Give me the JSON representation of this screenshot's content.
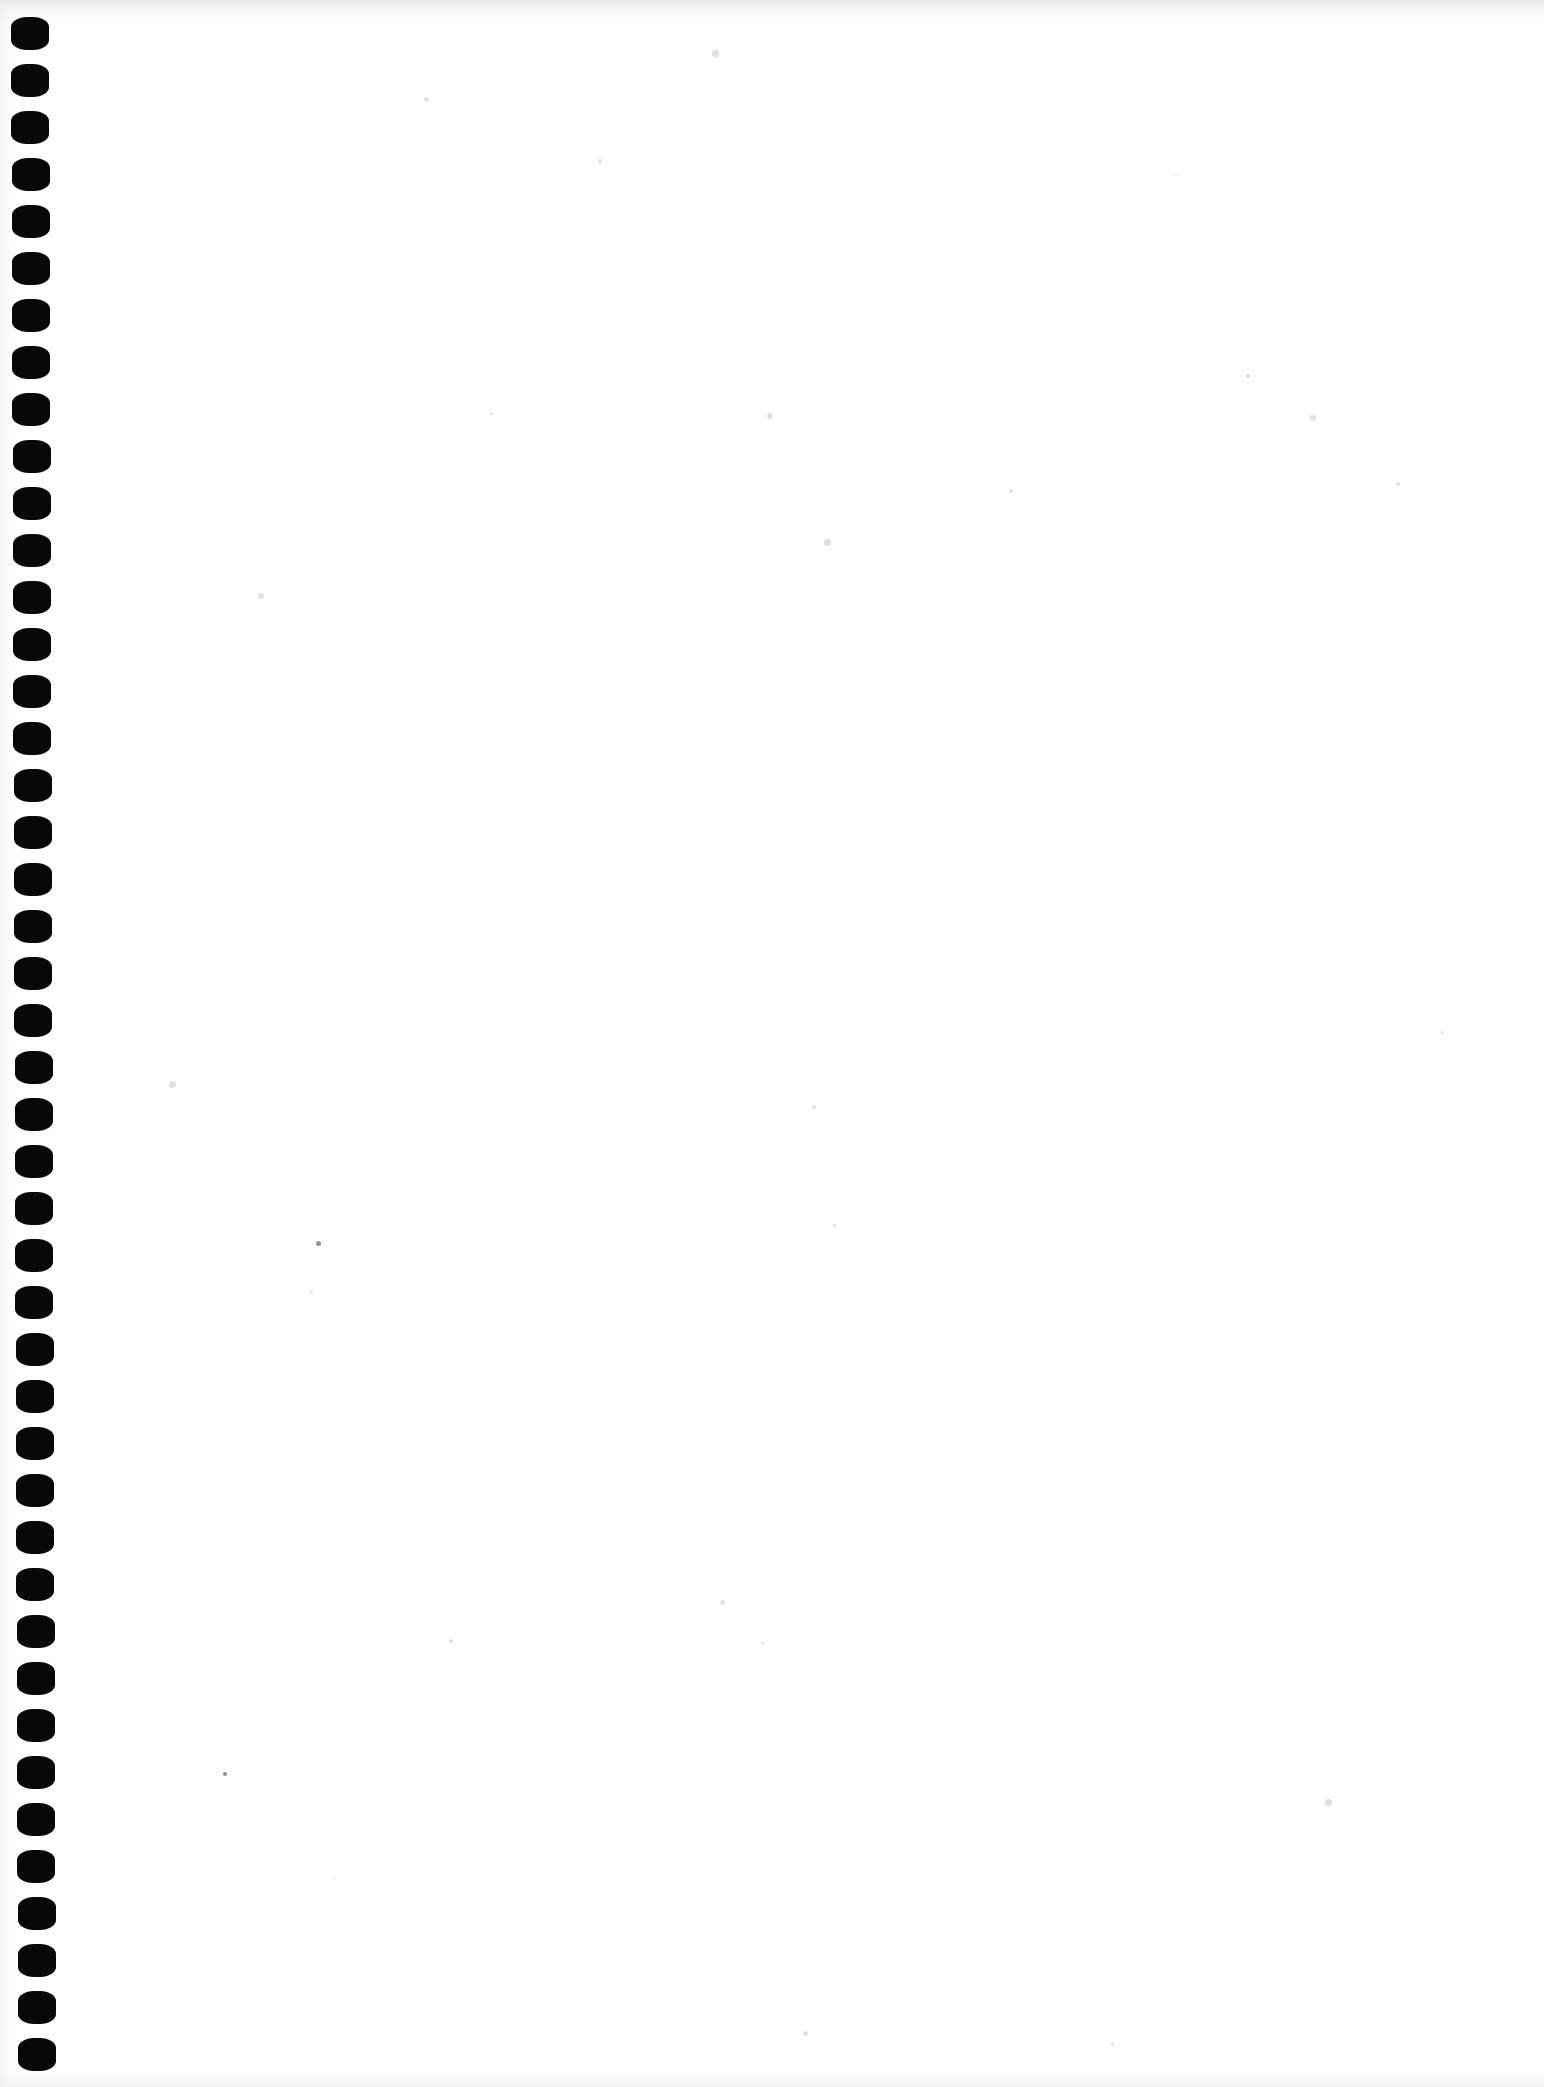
{
  "document": {
    "kind": "scanned-page",
    "title": "Blank notebook page",
    "page_label": "",
    "content_text": "",
    "paper_color": "#fefefe",
    "ink_color": "#080808",
    "width_px": 1544,
    "height_px": 2087,
    "orientation": "portrait",
    "has_visible_text": false,
    "has_visible_figures": false,
    "notes": "Scan of an empty spiral-bound notebook leaf; only the punched binding holes along the left edge are visible."
  },
  "binding": {
    "type": "spiral-punch-holes",
    "edge": "left",
    "hole_shape": "rounded-rectangle",
    "hole_color": "#080808",
    "hole_count": 44,
    "hole_width_px": 38,
    "hole_height_px": 33,
    "pitch_px": 47,
    "first_hole_top_px": 17,
    "left_offset_top_px": 11,
    "left_offset_bottom_px": 18,
    "skew_note": "holes drift slightly rightward toward the bottom of the scan"
  },
  "scan_artifacts": {
    "top_edge_band": "#cdcdd0",
    "bottom_edge_band": "#e8e8eb",
    "left_edge_band": "#ececee",
    "speck_color": "#c9c9cc",
    "dark_speck_color": "#6f6f74",
    "speck_count": 26
  }
}
